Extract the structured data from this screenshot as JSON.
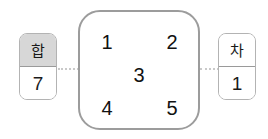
{
  "diagram": {
    "center_card": {
      "name": "number-grid-card",
      "cells": [
        {
          "id": "cell-1",
          "value": "1"
        },
        {
          "id": "cell-2",
          "value": "2"
        },
        {
          "id": "cell-3",
          "value": "3"
        },
        {
          "id": "cell-4",
          "value": "4"
        },
        {
          "id": "cell-5",
          "value": "5"
        }
      ]
    },
    "left_box": {
      "name": "sum-box",
      "label": "합",
      "value": "7",
      "label_background": "#d7d7d7"
    },
    "right_box": {
      "name": "difference-box",
      "label": "차",
      "value": "1",
      "label_background": "#ffffff"
    },
    "connectors": {
      "left": "dotted-line-left",
      "right": "dotted-line-right",
      "color": "#c9c9c9"
    },
    "colors": {
      "background": "#ffffff",
      "card_border": "#9c9c9c",
      "box_border": "#b3b3b3",
      "text": "#111111"
    }
  }
}
